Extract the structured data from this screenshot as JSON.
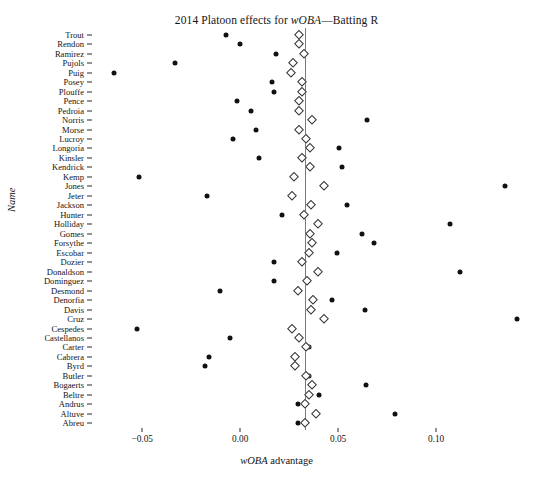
{
  "chart_data": {
    "type": "scatter",
    "title": "2014 Platoon effects for wOBA—Batting R",
    "title_italic_parts": [
      "wOBA"
    ],
    "xlabel": "wOBA advantage",
    "ylabel": "Name",
    "xlim": [
      -0.0695,
      0.1469
    ],
    "xticks": [
      -0.05,
      0.0,
      0.05,
      0.1
    ],
    "xticklabels": [
      "−0.05",
      "0.00",
      "0.05",
      "0.10"
    ],
    "grid": false,
    "legend": null,
    "reference_line": {
      "orientation": "vertical",
      "value": 0.0332,
      "color": "#7a7a7a"
    },
    "series": [
      {
        "name": "observed",
        "marker": "filled-circle",
        "color": "#111111"
      },
      {
        "name": "shrunken estimate",
        "marker": "open-diamond",
        "color": "#333333"
      }
    ],
    "categories": [
      "Trout",
      "Rendon",
      "Ramirez",
      "Pujols",
      "Puig",
      "Posey",
      "Plouffe",
      "Pence",
      "Pedroia",
      "Norris",
      "Morse",
      "Lucroy",
      "Longoria",
      "Kinsler",
      "Kendrick",
      "Kemp",
      "Jones",
      "Jeter",
      "Jackson",
      "Hunter",
      "Holliday",
      "Gomes",
      "Forsythe",
      "Escobar",
      "Dozier",
      "Donaldson",
      "Dominguez",
      "Desmond",
      "Denorfia",
      "Davis",
      "Cruz",
      "Cespedes",
      "Castellanos",
      "Carter",
      "Cabrera",
      "Byrd",
      "Butler",
      "Bogaerts",
      "Beltre",
      "Andrus",
      "Altuve",
      "Abreu"
    ],
    "observed": [
      -0.0071,
      -0.0,
      0.0184,
      -0.0332,
      -0.0643,
      0.0163,
      0.0173,
      -0.0015,
      0.0056,
      0.0648,
      0.0082,
      -0.0036,
      0.0505,
      0.0097,
      0.052,
      -0.0515,
      0.1352,
      -0.0168,
      0.0546,
      0.0214,
      0.1071,
      0.0622,
      0.0684,
      0.0495,
      0.0173,
      0.1122,
      0.0173,
      -0.0102,
      0.0469,
      0.0638,
      0.1413,
      -0.0526,
      -0.0051,
      0.0352,
      -0.0158,
      -0.0179,
      0.0352,
      0.0643,
      0.0403,
      0.0296,
      0.0791,
      0.0296
    ],
    "shrunken": [
      0.0301,
      0.0301,
      0.0327,
      0.027,
      0.026,
      0.0316,
      0.0316,
      0.0301,
      0.0301,
      0.0367,
      0.0301,
      0.0337,
      0.0357,
      0.0316,
      0.0357,
      0.0276,
      0.0429,
      0.0265,
      0.0362,
      0.0327,
      0.0398,
      0.0357,
      0.0367,
      0.0352,
      0.0316,
      0.0398,
      0.0342,
      0.0296,
      0.0372,
      0.0362,
      0.0429,
      0.0265,
      0.0301,
      0.0337,
      0.0281,
      0.0281,
      0.0337,
      0.0367,
      0.0352,
      0.0332,
      0.0388,
      0.0332
    ]
  }
}
